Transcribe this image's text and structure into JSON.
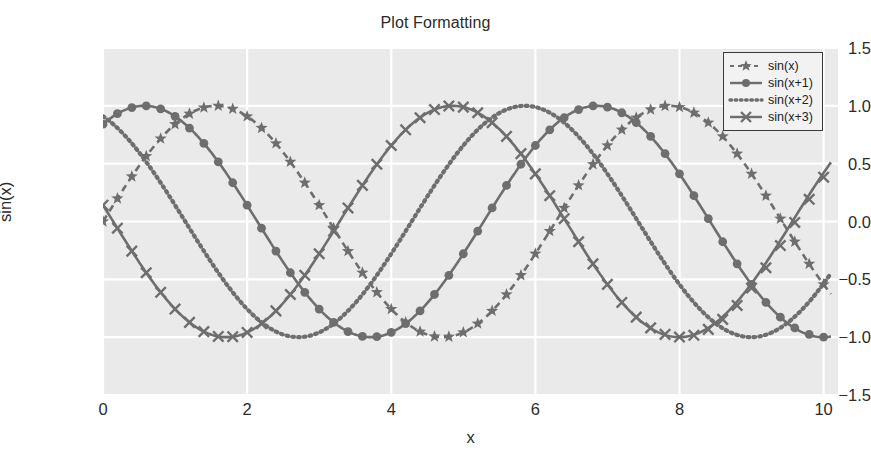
{
  "chart_data": {
    "type": "line",
    "title": "Plot Formatting",
    "xlabel": "x",
    "ylabel": "sin(x)",
    "xlim": [
      0,
      10.2
    ],
    "ylim": [
      -1.5,
      1.5
    ],
    "grid": true,
    "grid_color": "#ffffff",
    "plot_bgcolor": "#eaeaea",
    "line_color": "#6e6e6e",
    "legend_position": "upper right",
    "xticks": [
      0,
      2,
      4,
      6,
      8,
      10
    ],
    "xtick_labels": [
      "0",
      "2",
      "4",
      "6",
      "8",
      "10"
    ],
    "yticks": [
      1.5,
      1.0,
      0.5,
      0.0,
      -0.5,
      -1.0,
      -1.5
    ],
    "ytick_labels": [
      "1.5",
      "1.0",
      "0.5",
      "0.0",
      "−0.5",
      "−1.0",
      "−1.5"
    ],
    "x": [
      0.0,
      0.2,
      0.4,
      0.6,
      0.8,
      1.0,
      1.2,
      1.4,
      1.6,
      1.8,
      2.0,
      2.2,
      2.4,
      2.6,
      2.8,
      3.0,
      3.2,
      3.4,
      3.6,
      3.8,
      4.0,
      4.2,
      4.4,
      4.6,
      4.8,
      5.0,
      5.2,
      5.4,
      5.6,
      5.8,
      6.0,
      6.2,
      6.4,
      6.6,
      6.8,
      7.0,
      7.2,
      7.4,
      7.6,
      7.8,
      8.0,
      8.2,
      8.4,
      8.6,
      8.8,
      9.0,
      9.2,
      9.4,
      9.6,
      9.8,
      10.0
    ],
    "series": [
      {
        "name": "sin(x)",
        "expression": "sin(x)",
        "phase": 0,
        "linestyle": "dashed",
        "marker": "star",
        "color": "#6e6e6e",
        "values": [
          0.0,
          0.199,
          0.389,
          0.565,
          0.717,
          0.841,
          0.932,
          0.985,
          1.0,
          0.974,
          0.909,
          0.808,
          0.675,
          0.516,
          0.335,
          0.141,
          -0.058,
          -0.256,
          -0.443,
          -0.612,
          -0.757,
          -0.872,
          -0.952,
          -0.994,
          -0.996,
          -0.959,
          -0.883,
          -0.773,
          -0.631,
          -0.465,
          -0.279,
          -0.083,
          0.117,
          0.312,
          0.495,
          0.657,
          0.793,
          0.897,
          0.968,
          0.999,
          0.989,
          0.94,
          0.855,
          0.736,
          0.587,
          0.412,
          0.223,
          0.024,
          -0.175,
          -0.366,
          -0.544
        ]
      },
      {
        "name": "sin(x+1)",
        "expression": "sin(x+1)",
        "phase": 1,
        "linestyle": "solid",
        "marker": "circle",
        "color": "#6e6e6e",
        "values": [
          0.841,
          0.932,
          0.985,
          1.0,
          0.974,
          0.909,
          0.808,
          0.675,
          0.516,
          0.335,
          0.141,
          -0.058,
          -0.256,
          -0.443,
          -0.612,
          -0.757,
          -0.872,
          -0.952,
          -0.994,
          -0.996,
          -0.959,
          -0.883,
          -0.773,
          -0.631,
          -0.465,
          -0.279,
          -0.083,
          0.117,
          0.312,
          0.495,
          0.657,
          0.793,
          0.897,
          0.968,
          0.999,
          0.989,
          0.94,
          0.855,
          0.736,
          0.587,
          0.412,
          0.223,
          0.024,
          -0.175,
          -0.366,
          -0.544,
          -0.7,
          -0.827,
          -0.92,
          -0.976,
          -0.999
        ]
      },
      {
        "name": "sin(x+2)",
        "expression": "sin(x+2)",
        "phase": 2,
        "linestyle": "dotted",
        "marker": "none",
        "color": "#6e6e6e",
        "values": [
          0.909,
          0.808,
          0.675,
          0.516,
          0.335,
          0.141,
          -0.058,
          -0.256,
          -0.443,
          -0.612,
          -0.757,
          -0.872,
          -0.952,
          -0.994,
          -0.996,
          -0.959,
          -0.883,
          -0.773,
          -0.631,
          -0.465,
          -0.279,
          -0.083,
          0.117,
          0.312,
          0.495,
          0.657,
          0.793,
          0.897,
          0.968,
          0.999,
          0.989,
          0.94,
          0.855,
          0.736,
          0.587,
          0.412,
          0.223,
          0.024,
          -0.175,
          -0.366,
          -0.544,
          -0.7,
          -0.827,
          -0.92,
          -0.976,
          -0.999,
          -0.984,
          -0.933,
          -0.846,
          -0.726,
          -0.575
        ]
      },
      {
        "name": "sin(x+3)",
        "expression": "sin(x+3)",
        "phase": 3,
        "linestyle": "solid",
        "marker": "x",
        "color": "#6e6e6e",
        "values": [
          0.141,
          -0.058,
          -0.256,
          -0.443,
          -0.612,
          -0.757,
          -0.872,
          -0.952,
          -0.994,
          -0.996,
          -0.959,
          -0.883,
          -0.773,
          -0.631,
          -0.465,
          -0.279,
          -0.083,
          0.117,
          0.312,
          0.495,
          0.657,
          0.793,
          0.897,
          0.968,
          0.999,
          0.989,
          0.94,
          0.855,
          0.736,
          0.587,
          0.412,
          0.223,
          0.024,
          -0.175,
          -0.366,
          -0.544,
          -0.7,
          -0.827,
          -0.92,
          -0.976,
          -0.999,
          -0.984,
          -0.933,
          -0.846,
          -0.726,
          -0.575,
          -0.4,
          -0.208,
          -0.008,
          0.192,
          0.383
        ]
      }
    ]
  },
  "legend": {
    "entries": [
      {
        "label": "sin(x)",
        "style": "dashed-star"
      },
      {
        "label": "sin(x+1)",
        "style": "solid-circle"
      },
      {
        "label": "sin(x+2)",
        "style": "dotted"
      },
      {
        "label": "sin(x+3)",
        "style": "solid-x"
      }
    ]
  }
}
